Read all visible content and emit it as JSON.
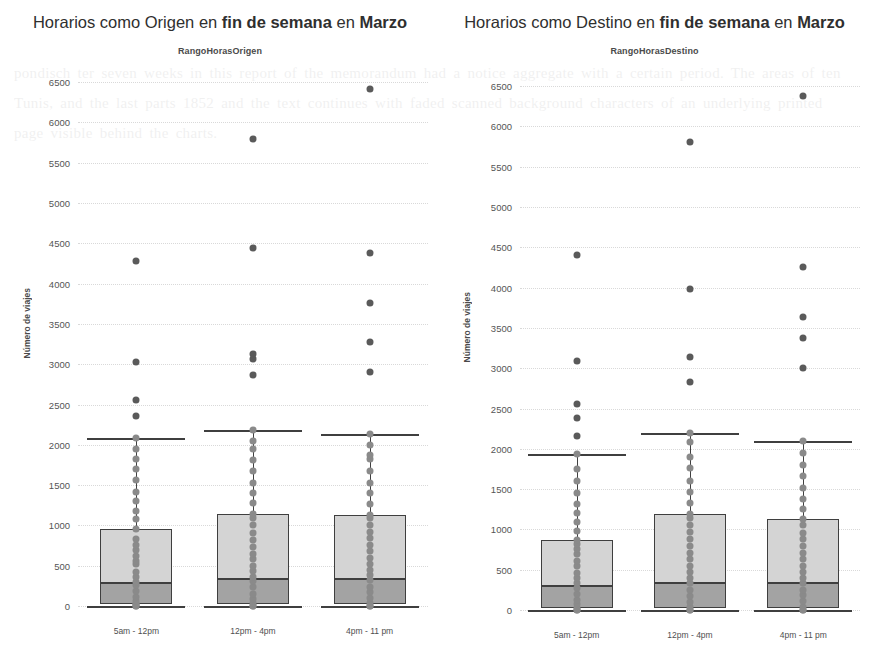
{
  "page": {
    "background_texture_text": "pondisch ter seven weeks in this report of the memorandum had a notice aggregate with a certain period. The areas of ten Tunis, and the last parts 1852 and the text continues with faded scanned background characters of an underlying printed page visible behind the charts."
  },
  "charts": [
    {
      "id": "origen",
      "title_plain_1": "Horarios como Origen en ",
      "title_bold_1": "fin de semana",
      "title_plain_2": " en ",
      "title_bold_2": "Marzo",
      "legend_title": "RangoHorasOrigen",
      "ylabel": "Número de viajes",
      "chart_data": {
        "type": "box",
        "title": "Horarios como Origen en fin de semana en Marzo",
        "xlabel": "RangoHorasOrigen",
        "ylabel": "Número de viajes",
        "ylim": [
          0,
          6700
        ],
        "yticks": [
          0,
          500,
          1000,
          1500,
          2000,
          2500,
          3000,
          3500,
          4000,
          4500,
          5000,
          5500,
          6000,
          6500
        ],
        "grid": true,
        "legend_position": "top-center",
        "categories": [
          "5am - 12pm",
          "12pm - 4pm",
          "4pm - 11 pm"
        ],
        "boxes": [
          {
            "category": "5am - 12pm",
            "whisker_low": 0,
            "q1": 20,
            "median": 280,
            "q3": 960,
            "whisker_high": 2090,
            "outliers": [
              4280,
              3030,
              2550,
              2360
            ],
            "points": [
              0,
              0,
              20,
              30,
              60,
              110,
              180,
              260,
              300,
              360,
              420,
              520,
              560,
              620,
              700,
              760,
              830,
              960,
              1080,
              1180,
              1300,
              1420,
              1560,
              1700,
              1830,
              1950,
              2090
            ]
          },
          {
            "category": "12pm - 4pm",
            "whisker_low": 0,
            "q1": 30,
            "median": 330,
            "q3": 1140,
            "whisker_high": 2180,
            "outliers": [
              5790,
              4440,
              3130,
              3060,
              2870
            ],
            "points": [
              0,
              0,
              40,
              90,
              150,
              230,
              310,
              360,
              430,
              500,
              580,
              650,
              730,
              820,
              900,
              1000,
              1090,
              1140,
              1280,
              1400,
              1520,
              1680,
              1810,
              1950,
              2050,
              2180
            ]
          },
          {
            "category": "4pm - 11 pm",
            "whisker_low": 0,
            "q1": 30,
            "median": 340,
            "q3": 1130,
            "whisker_high": 2140,
            "outliers": [
              6410,
              4380,
              3760,
              3280,
              2900
            ],
            "points": [
              0,
              0,
              40,
              100,
              170,
              240,
              320,
              380,
              450,
              520,
              600,
              680,
              760,
              840,
              920,
              1010,
              1090,
              1130,
              1270,
              1400,
              1530,
              1680,
              1830,
              1870,
              2000,
              2140
            ]
          }
        ]
      }
    },
    {
      "id": "destino",
      "title_plain_1": "Horarios como Destino en ",
      "title_bold_1": "fin de semana",
      "title_plain_2": " en ",
      "title_bold_2": "Marzo",
      "legend_title": "RangoHorasDestino",
      "ylabel": "Número de viajes",
      "chart_data": {
        "type": "box",
        "title": "Horarios como Destino en fin de semana en Marzo",
        "xlabel": "RangoHorasDestino",
        "ylabel": "Número de viajes",
        "ylim": [
          0,
          6700
        ],
        "yticks": [
          0,
          500,
          1000,
          1500,
          2000,
          2500,
          3000,
          3500,
          4000,
          4500,
          5000,
          5500,
          6000,
          6500
        ],
        "grid": true,
        "legend_position": "top-center",
        "categories": [
          "5am - 12pm",
          "12pm - 4pm",
          "4pm - 11 pm"
        ],
        "boxes": [
          {
            "category": "5am - 12pm",
            "whisker_low": 0,
            "q1": 30,
            "median": 300,
            "q3": 870,
            "whisker_high": 1930,
            "outliers": [
              4400,
              3090,
              2560,
              2380,
              2160
            ],
            "points": [
              0,
              0,
              30,
              70,
              130,
              200,
              270,
              330,
              400,
              460,
              540,
              610,
              690,
              760,
              820,
              870,
              980,
              1090,
              1200,
              1320,
              1450,
              1600,
              1750,
              1930
            ]
          },
          {
            "category": "12pm - 4pm",
            "whisker_low": 0,
            "q1": 30,
            "median": 340,
            "q3": 1190,
            "whisker_high": 2200,
            "outliers": [
              5810,
              3980,
              3140,
              2830
            ],
            "points": [
              0,
              0,
              40,
              100,
              170,
              250,
              330,
              400,
              470,
              550,
              630,
              710,
              800,
              880,
              970,
              1060,
              1140,
              1190,
              1330,
              1460,
              1600,
              1760,
              1900,
              2090,
              2200
            ]
          },
          {
            "category": "4pm - 11 pm",
            "whisker_low": 0,
            "q1": 30,
            "median": 330,
            "q3": 1130,
            "whisker_high": 2100,
            "outliers": [
              6380,
              4260,
              3640,
              3370,
              3000
            ],
            "points": [
              0,
              0,
              40,
              110,
              180,
              250,
              330,
              400,
              470,
              550,
              630,
              710,
              790,
              880,
              960,
              1050,
              1130,
              1250,
              1380,
              1510,
              1660,
              1800,
              1950,
              2100
            ]
          }
        ]
      }
    }
  ]
}
